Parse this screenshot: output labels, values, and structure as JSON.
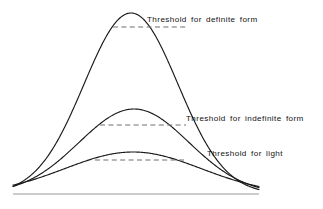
{
  "figure": {
    "title": "",
    "background_color": "#ffffff",
    "curve_color": "#1a1a1a",
    "threshold_color": "#6f6f6f",
    "baseline_color": "#9a9a9a",
    "text_color": "#111111"
  },
  "chart_data": {
    "type": "line",
    "title": "",
    "xlabel": "",
    "ylabel": "",
    "grid": false,
    "legend_position": "inline-right",
    "axis": {
      "baseline_y": 194,
      "x_start": 13,
      "x_end": 259,
      "xlim": [
        13,
        259
      ],
      "ylim": [
        0,
        194
      ]
    },
    "series": [
      {
        "name": "definite form response",
        "label": "Threshold for definite form",
        "peak_x": 131,
        "peak_y": 13,
        "amplitude": 181,
        "spread": 47,
        "threshold_value": 27,
        "threshold_x_start": 113,
        "threshold_x_end": 186
      },
      {
        "name": "indefinite form response",
        "label": "Threshold for indefinite form",
        "peak_x": 134,
        "peak_y": 109,
        "amplitude": 85,
        "spread": 55,
        "threshold_value": 125,
        "threshold_x_start": 100,
        "threshold_x_end": 186
      },
      {
        "name": "light response",
        "label": "Threshold for light",
        "peak_x": 133,
        "peak_y": 152,
        "amplitude": 42,
        "spread": 68,
        "threshold_value": 160,
        "threshold_x_start": 95,
        "threshold_x_end": 186
      }
    ],
    "annotations": [
      {
        "text": "Threshold for definite form",
        "x": 147,
        "y": 22
      },
      {
        "text": "Threshold for indefinite form",
        "x": 186,
        "y": 121
      },
      {
        "text": "Threshold for light",
        "x": 207,
        "y": 156
      }
    ]
  }
}
